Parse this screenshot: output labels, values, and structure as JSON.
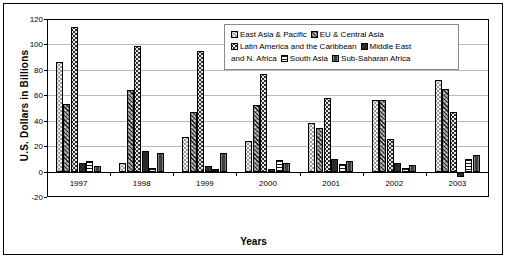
{
  "chart_data": {
    "type": "bar",
    "title": "",
    "xlabel": "Years",
    "ylabel": "U.S. Dollars in Billions",
    "categories": [
      "1997",
      "1998",
      "1999",
      "2000",
      "2001",
      "2002",
      "2003"
    ],
    "ylim": [
      -20,
      120
    ],
    "yticks": [
      -20,
      0,
      20,
      40,
      60,
      80,
      100,
      120
    ],
    "ytick_labels": [
      "-20",
      "0",
      "20",
      "40",
      "60",
      "80",
      "100",
      "120"
    ],
    "grid": true,
    "legend_position": "inside-top-right",
    "series": [
      {
        "name": "East Asia & Pacific",
        "pattern": "light-dotted",
        "values": [
          86,
          7,
          27,
          24,
          38,
          56,
          72
        ]
      },
      {
        "name": "EU & Central Asia",
        "pattern": "gray-crosshatch",
        "values": [
          53,
          64,
          47,
          52,
          34,
          56,
          65
        ]
      },
      {
        "name": "Latin America and the Caribbean",
        "pattern": "dark-dotted",
        "values": [
          114,
          99,
          95,
          77,
          58,
          26,
          47
        ]
      },
      {
        "name": "Middle East and N. Africa",
        "pattern": "solid-dark",
        "values": [
          7,
          16,
          4,
          2,
          10,
          7,
          -4
        ]
      },
      {
        "name": "South Asia",
        "pattern": "horizontal-stripes",
        "values": [
          8,
          3,
          2,
          9,
          6,
          3,
          10
        ]
      },
      {
        "name": "Sub-Saharan Africa",
        "pattern": "dark-vertical-stripes",
        "values": [
          4,
          15,
          15,
          7,
          8,
          5,
          13
        ]
      }
    ]
  },
  "axes": {
    "y_title": "U.S. Dollars in Billions",
    "x_title": "Years"
  },
  "legend": {
    "items": [
      {
        "label": "East Asia & Pacific",
        "swatch": "east-asia-pacific-swatch"
      },
      {
        "label": "EU & Central Asia",
        "swatch": "eu-central-asia-swatch"
      },
      {
        "label": "Latin America and the Caribbean",
        "swatch": "latin-america-swatch"
      },
      {
        "label": "Middle East and N. Africa",
        "swatch": "middle-east-swatch"
      },
      {
        "label": "South Asia",
        "swatch": "south-asia-swatch"
      },
      {
        "label": "Sub-Saharan Africa",
        "swatch": "sub-saharan-africa-swatch"
      }
    ],
    "line1_a": "East Asia & Pacific",
    "line1_b": "EU & Central Asia",
    "line2_a": "Latin America and the Caribbean",
    "line2_b": "Middle East",
    "line3_pre": "and N. Africa",
    "line3_a": "South Asia",
    "line3_b": "Sub-Saharan Africa"
  },
  "colors": {
    "axis": "#000000",
    "gridline": "#b9b9b9",
    "background": "#ffffff",
    "east_asia": "#f2f2f2",
    "eu_central": "#8d8d8d",
    "latin_america": "#2e2e2e",
    "middle_east": "#2b2b2b",
    "south_asia": "#ffffff",
    "sub_saharan": "#3d3d3d"
  }
}
